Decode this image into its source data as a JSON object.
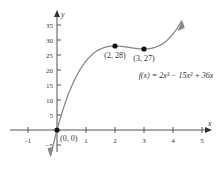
{
  "chart_data": {
    "type": "line",
    "title": "",
    "xlabel": "x",
    "ylabel": "y",
    "xlim": [
      -1.2,
      5.2
    ],
    "ylim": [
      -7,
      39
    ],
    "x_ticks": [
      -1,
      1,
      2,
      3,
      4,
      5
    ],
    "y_ticks": [
      -5,
      5,
      10,
      15,
      20,
      25,
      30,
      35
    ],
    "grid": false,
    "function_label": "f(x) = 2x³ − 15x² + 36x",
    "series": [
      {
        "name": "f(x) = 2x^3 - 15x^2 + 36x",
        "x": [
          -0.2,
          0,
          0.5,
          1,
          1.5,
          2,
          2.5,
          3,
          3.5,
          4,
          4.3
        ],
        "y": [
          -7.8,
          0,
          14.5,
          23,
          27,
          28,
          27.5,
          27,
          28,
          32,
          35.6
        ]
      }
    ],
    "points": [
      {
        "label": "(0, 0)",
        "x": 0,
        "y": 0
      },
      {
        "label": "(2, 28)",
        "x": 2,
        "y": 28
      },
      {
        "label": "(3, 27)",
        "x": 3,
        "y": 27
      }
    ]
  }
}
